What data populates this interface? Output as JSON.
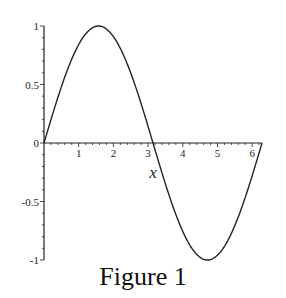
{
  "chart_data": {
    "type": "line",
    "title": "",
    "caption": "Figure 1",
    "xlabel": "x",
    "ylabel": "",
    "xlim": [
      0,
      6.2832
    ],
    "ylim": [
      -1,
      1
    ],
    "x_ticks": [
      1,
      2,
      3,
      4,
      5,
      6
    ],
    "y_ticks": [
      -1,
      -0.5,
      0,
      0.5,
      1
    ],
    "y_tick_labels": [
      "-1",
      "-0.5",
      "0",
      "0.5",
      "1"
    ],
    "grid": false,
    "legend": null,
    "series": [
      {
        "name": "sin(x)",
        "x": [
          0,
          0.5,
          1,
          1.5708,
          2,
          2.5,
          3,
          3.1416,
          3.5,
          4,
          4.5,
          4.7124,
          5,
          5.5,
          6,
          6.2832
        ],
        "y": [
          0,
          0.479,
          0.841,
          1,
          0.909,
          0.598,
          0.141,
          0,
          -0.351,
          -0.757,
          -0.978,
          -1,
          -0.959,
          -0.706,
          -0.279,
          0
        ]
      }
    ]
  }
}
